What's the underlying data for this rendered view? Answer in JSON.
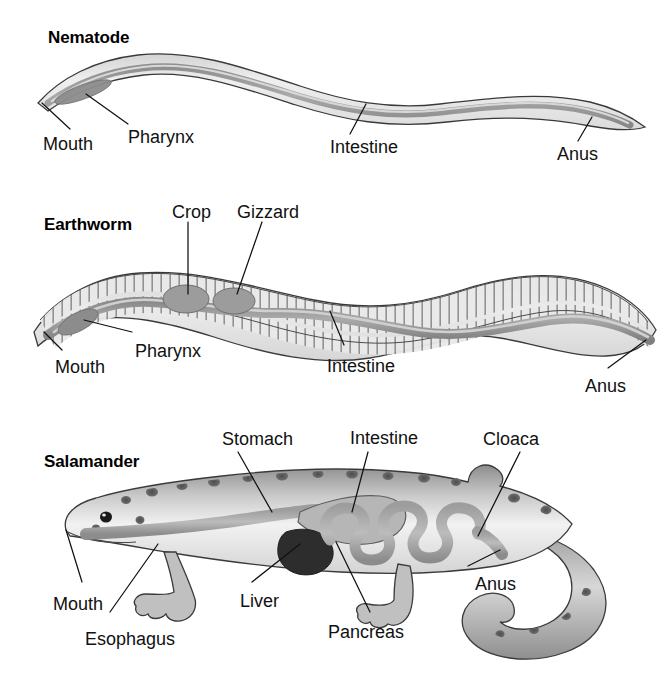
{
  "figure": {
    "background_color": "#ffffff",
    "text_color": "#111111",
    "line_color": "#3a3a3a"
  },
  "panels": [
    {
      "id": "nematode",
      "title": "Nematode",
      "labels": [
        {
          "name": "mouth",
          "text": "Mouth"
        },
        {
          "name": "pharynx",
          "text": "Pharynx"
        },
        {
          "name": "intestine",
          "text": "Intestine"
        },
        {
          "name": "anus",
          "text": "Anus"
        }
      ]
    },
    {
      "id": "earthworm",
      "title": "Earthworm",
      "labels": [
        {
          "name": "crop",
          "text": "Crop"
        },
        {
          "name": "gizzard",
          "text": "Gizzard"
        },
        {
          "name": "pharynx",
          "text": "Pharynx"
        },
        {
          "name": "mouth",
          "text": "Mouth"
        },
        {
          "name": "intestine",
          "text": "Intestine"
        },
        {
          "name": "anus",
          "text": "Anus"
        }
      ]
    },
    {
      "id": "salamander",
      "title": "Salamander",
      "labels": [
        {
          "name": "stomach",
          "text": "Stomach"
        },
        {
          "name": "intestine",
          "text": "Intestine"
        },
        {
          "name": "cloaca",
          "text": "Cloaca"
        },
        {
          "name": "mouth",
          "text": "Mouth"
        },
        {
          "name": "liver",
          "text": "Liver"
        },
        {
          "name": "anus",
          "text": "Anus"
        },
        {
          "name": "esophagus",
          "text": "Esophagus"
        },
        {
          "name": "pancreas",
          "text": "Pancreas"
        }
      ]
    }
  ],
  "nematode": {
    "title": "Nematode",
    "mouth": "Mouth",
    "pharynx": "Pharynx",
    "intestine": "Intestine",
    "anus": "Anus"
  },
  "earthworm": {
    "title": "Earthworm",
    "crop": "Crop",
    "gizzard": "Gizzard",
    "pharynx": "Pharynx",
    "mouth": "Mouth",
    "intestine": "Intestine",
    "anus": "Anus"
  },
  "salamander": {
    "title": "Salamander",
    "stomach": "Stomach",
    "intestine": "Intestine",
    "cloaca": "Cloaca",
    "mouth": "Mouth",
    "liver": "Liver",
    "anus": "Anus",
    "esophagus": "Esophagus",
    "pancreas": "Pancreas"
  },
  "colors": {
    "body_fill_light": "#ebebeb",
    "body_fill_mid": "#c9c9c9",
    "gut_fill": "#9a9a9a",
    "gut_fill_dark": "#7d7d7d",
    "liver_fill": "#2f2f2f",
    "outline": "#3a3a3a",
    "segment_fill": "#e2e2e2",
    "skin_dark": "#6f6f6f",
    "spot_color": "#4a4a4a"
  }
}
